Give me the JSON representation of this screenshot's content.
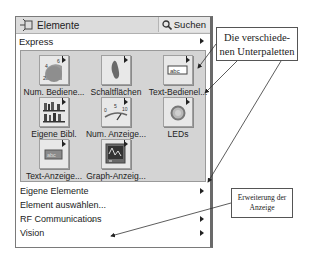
{
  "palette": {
    "title": "Elemente",
    "search_label": "Suchen",
    "category": "Express",
    "tiles": [
      {
        "label": "Num. Bediene...",
        "icon": "numeric-control-knob-icon"
      },
      {
        "label": "Schaltflächen",
        "icon": "button-switch-icon"
      },
      {
        "label": "Text-Bedienel...",
        "icon": "text-control-abc-icon"
      },
      {
        "label": "Eigene Bibl.",
        "icon": "user-library-icon"
      },
      {
        "label": "Num. Anzeige...",
        "icon": "numeric-indicator-gauge-icon"
      },
      {
        "label": "LEDs",
        "icon": "led-icon"
      },
      {
        "label": "Text-Anzeige...",
        "icon": "text-indicator-abc-icon"
      },
      {
        "label": "Graph-Anzeig...",
        "icon": "graph-indicator-icon"
      }
    ],
    "list_items": [
      {
        "label": "Eigene Elemente",
        "has_submenu": true
      },
      {
        "label": "Element auswählen...",
        "has_submenu": false
      },
      {
        "label": "RF Communications",
        "has_submenu": true
      },
      {
        "label": "Vision",
        "has_submenu": true
      }
    ],
    "expand_glyph": "⌄"
  },
  "annotations": {
    "subpalettes": "Die verschiede-nen Unterpaletten",
    "subpalettes_line1": "Die verschiede-",
    "subpalettes_line2": "nen Unterpaletten",
    "expand_line1": "Erweiterung der",
    "expand_line2": "Anzeige"
  }
}
